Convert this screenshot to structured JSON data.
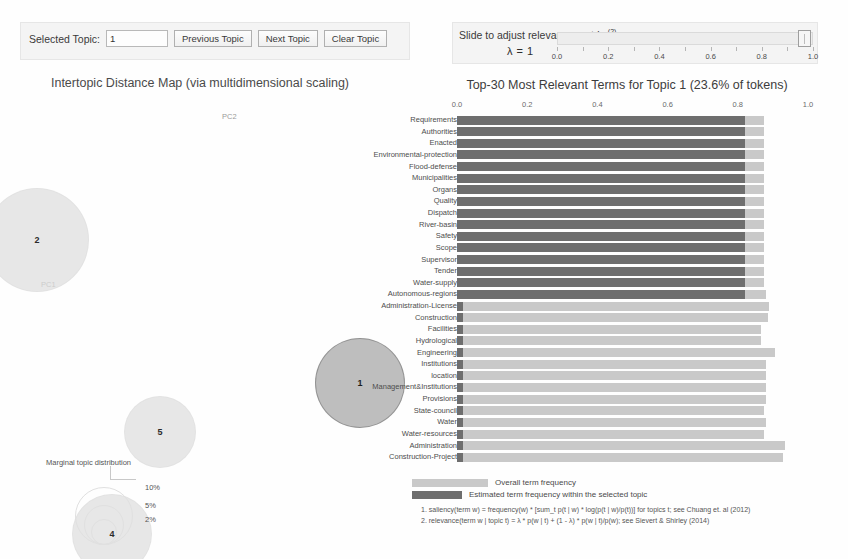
{
  "controls": {
    "selected_topic_label": "Selected Topic:",
    "selected_topic_value": "1",
    "previous_topic": "Previous Topic",
    "next_topic": "Next Topic",
    "clear_topic": "Clear Topic"
  },
  "slider": {
    "label": "Slide to adjust relevance metric:",
    "label_sup": "(2)",
    "lambda_text": "λ = 1",
    "value": 1.0,
    "ticks": [
      {
        "value": 0.0,
        "label": "0.0"
      },
      {
        "value": 0.1,
        "label": ""
      },
      {
        "value": 0.2,
        "label": "0.2"
      },
      {
        "value": 0.3,
        "label": ""
      },
      {
        "value": 0.4,
        "label": "0.4"
      },
      {
        "value": 0.5,
        "label": ""
      },
      {
        "value": 0.6,
        "label": "0.6"
      },
      {
        "value": 0.7,
        "label": ""
      },
      {
        "value": 0.8,
        "label": "0.8"
      },
      {
        "value": 0.9,
        "label": ""
      },
      {
        "value": 1.0,
        "label": "1.0"
      }
    ]
  },
  "map": {
    "title": "Intertopic Distance Map (via multidimensional scaling)",
    "axis_x_label": "PC1",
    "axis_y_label": "PC2",
    "marginal_label": "Marginal topic distribution",
    "size_legend": [
      {
        "label": "2%"
      },
      {
        "label": "5%"
      },
      {
        "label": "10%"
      }
    ],
    "topics": [
      {
        "id": "2",
        "cx": 37,
        "cy": 145,
        "r": 52,
        "selected": false
      },
      {
        "id": "1",
        "cx": 360,
        "cy": 288,
        "r": 45,
        "selected": true
      },
      {
        "id": "5",
        "cx": 160,
        "cy": 337,
        "r": 36,
        "selected": false
      },
      {
        "id": "4",
        "cx": 112,
        "cy": 439,
        "r": 40,
        "selected": false
      }
    ]
  },
  "chart_data": {
    "type": "bar",
    "title": "Top-30 Most Relevant Terms for Topic 1 (23.6% of tokens)",
    "orientation": "horizontal",
    "xlabel": "",
    "ylabel": "",
    "xlim": [
      0.0,
      1.0
    ],
    "xticks": [
      0.0,
      0.2,
      0.4,
      0.6,
      0.8,
      1.0
    ],
    "xtick_labels": [
      "0.0",
      "0.2",
      "0.4",
      "0.6",
      "0.8",
      "1.0"
    ],
    "grid": false,
    "legend_position": "bottom",
    "series": [
      {
        "name": "Overall term frequency",
        "color": "#c9c9c9"
      },
      {
        "name": "Estimated term frequency within the selected topic",
        "color": "#6e6e6e"
      }
    ],
    "categories": [
      "Requirements",
      "Authorities",
      "Enacted",
      "Environmental-protection",
      "Flood-defense",
      "Municipalities",
      "Organs",
      "Quality",
      "Dispatch",
      "River-basin",
      "Safety",
      "Scope",
      "Supervisor",
      "Tender",
      "Water-supply",
      "Autonomous-regions",
      "Administration-License",
      "Construction",
      "Facilities",
      "Hydrological",
      "Engineering",
      "Institutions",
      "location",
      "Management&Institutions",
      "Provisions",
      "State-council",
      "Water",
      "Water-resources",
      "Administration",
      "Construction-Project"
    ],
    "overall": [
      0.875,
      0.875,
      0.875,
      0.875,
      0.875,
      0.875,
      0.875,
      0.875,
      0.875,
      0.875,
      0.875,
      0.875,
      0.875,
      0.875,
      0.875,
      0.88,
      0.89,
      0.885,
      0.865,
      0.865,
      0.905,
      0.88,
      0.88,
      0.88,
      0.88,
      0.875,
      0.88,
      0.875,
      0.935,
      0.93
    ],
    "within_topic": [
      0.82,
      0.82,
      0.82,
      0.82,
      0.82,
      0.82,
      0.82,
      0.82,
      0.82,
      0.82,
      0.82,
      0.82,
      0.82,
      0.82,
      0.82,
      0.82,
      0.016,
      0.016,
      0.016,
      0.016,
      0.016,
      0.016,
      0.016,
      0.016,
      0.016,
      0.016,
      0.016,
      0.016,
      0.018,
      0.018
    ]
  },
  "footnotes": [
    "1. saliency(term w) = frequency(w) * [sum_t p(t | w) * log(p(t | w)/p(t))] for topics t; see Chuang et. al (2012)",
    "2. relevance(term w | topic t) = λ * p(w | t) + (1 - λ) * p(w | t)/p(w); see Sievert & Shirley (2014)"
  ]
}
